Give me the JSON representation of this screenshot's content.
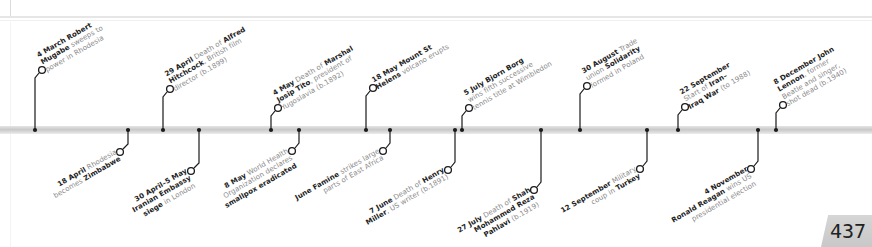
{
  "page_number": "437",
  "colors": {
    "line": "#1a1a1a",
    "bold_text": "#222222",
    "body_text": "#8a8a8a",
    "bar": "#d0d0d0",
    "page_tab": "#cfcfcf"
  },
  "events_above": [
    {
      "date": "4 March",
      "parts": [
        [
          "b",
          "Robert"
        ],
        [
          "t",
          " "
        ],
        [
          "nl",
          ""
        ],
        [
          "b",
          "Mugabe"
        ],
        [
          "t",
          " sweeps to"
        ],
        [
          "nl",
          ""
        ],
        [
          "t",
          "power in Rhodesia"
        ]
      ],
      "html_lines": [
        "<b>4 March Robert</b>",
        "<b>Mugabe</b> sweeps to",
        "power in Rhodesia"
      ],
      "dot_x": 35,
      "circle": [
        42,
        70
      ]
    },
    {
      "date": "29 April",
      "html_lines": [
        "<b>29 April</b> Death of <b>Alfred</b>",
        "<b>Hitchcock</b>, British film",
        "director (b.1899)"
      ],
      "dot_x": 163,
      "circle": [
        170,
        89
      ]
    },
    {
      "date": "4 May",
      "html_lines": [
        "<b>4 May</b> Death of <b>Marshal</b>",
        "<b>Josip Tito</b>, president of",
        "Yugoslavia (b.1892)"
      ],
      "dot_x": 271,
      "circle": [
        278,
        108
      ]
    },
    {
      "date": "18 May",
      "html_lines": [
        "<b>18 May Mount St</b>",
        "<b>Helens</b> volcano erupts"
      ],
      "dot_x": 366,
      "circle": [
        373,
        88
      ]
    },
    {
      "date": "5 July",
      "html_lines": [
        "<b>5 July Bjorn Borg</b>",
        "wins fifth successive",
        "tennis title at Wimbledon"
      ],
      "dot_x": 462,
      "circle": [
        469,
        108
      ]
    },
    {
      "date": "30 August",
      "html_lines": [
        "<b>30 August</b> Trade",
        "union <b>Solidarity</b>",
        "formed in Poland"
      ],
      "dot_x": 580,
      "circle": [
        587,
        86
      ]
    },
    {
      "date": "22 September",
      "html_lines": [
        "<b>22 September</b>",
        "Start of <b>Iran–</b>",
        "<b>Iraq War</b> (to 1988)"
      ],
      "dot_x": 678,
      "circle": [
        685,
        107
      ]
    },
    {
      "date": "8 December",
      "html_lines": [
        "<b>8 December John</b>",
        "<b>Lennon</b>, former",
        "Beatle and singer,",
        "shot dead (b.1940)"
      ],
      "dot_x": 776,
      "circle": [
        783,
        105
      ]
    }
  ],
  "events_below": [
    {
      "date": "18 April",
      "html_lines": [
        "<b>18 April</b> Rhodesia",
        "becomes <b>Zimbabwe</b>"
      ],
      "dot_x": 128,
      "circle": [
        120,
        152
      ]
    },
    {
      "date": "30 April–5 May",
      "html_lines": [
        "<b>30 April–5 May</b>",
        "<b>Iranian Embassy</b>",
        "<b>siege</b> in London"
      ],
      "dot_x": 199,
      "circle": [
        191,
        171
      ]
    },
    {
      "date": "8 May",
      "html_lines": [
        "<b>8 May</b> World Health",
        "Organization declares",
        "<b>smallpox eradicated</b>"
      ],
      "dot_x": 299,
      "circle": [
        292,
        151
      ]
    },
    {
      "date": "June",
      "html_lines": [
        "<b>June Famine</b> strikes large",
        "parts of East Africa"
      ],
      "dot_x": 390,
      "circle": [
        383,
        151
      ]
    },
    {
      "date": "7 June",
      "html_lines": [
        "<b>7 June</b> Death of <b>Henry</b>",
        "<b>Miller</b>, US writer (b.1891)"
      ],
      "dot_x": 455,
      "circle": [
        448,
        170
      ]
    },
    {
      "date": "27 July",
      "html_lines": [
        "<b>27 July</b> Death of <b>Shah</b>",
        "<b>Mohammed Reza</b>",
        "<b>Pahlavi</b> (b.1919)"
      ],
      "dot_x": 541,
      "circle": [
        534,
        190
      ]
    },
    {
      "date": "12 September",
      "html_lines": [
        "<b>12 September</b> Military",
        "coup in <b>Turkey</b>"
      ],
      "dot_x": 647,
      "circle": [
        640,
        169
      ]
    },
    {
      "date": "4 November",
      "html_lines": [
        "<b>4 November</b>",
        "<b>Ronald Reagan</b> wins US",
        "presidential election"
      ],
      "dot_x": 758,
      "circle": [
        751,
        169
      ]
    }
  ]
}
